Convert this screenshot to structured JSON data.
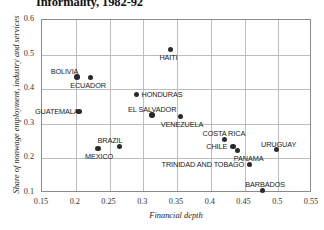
{
  "chart_data": {
    "type": "scatter",
    "title": "Informality, 1982-92",
    "xlabel": "Financial depth",
    "ylabel": "Share of nonwage employment, industry and services",
    "xlim": [
      0.15,
      0.55
    ],
    "ylim": [
      0.1,
      0.6
    ],
    "xticks": [
      "0.15",
      "0.2",
      "0.25",
      "0.3",
      "0.35",
      "0.4",
      "0.45",
      "0.5",
      "0.55"
    ],
    "xtick_values": [
      0.15,
      0.2,
      0.25,
      0.3,
      0.35,
      0.4,
      0.45,
      0.5,
      0.55
    ],
    "yticks": [
      "0.1",
      "0.2",
      "0.3",
      "0.4",
      "0.5",
      "0.6"
    ],
    "ytick_values": [
      0.1,
      0.2,
      0.3,
      0.4,
      0.5,
      0.6
    ],
    "grid": true,
    "legend": "none",
    "marker_color": "#2b2b2b",
    "points": [
      {
        "label": "HAITI",
        "x": 0.34,
        "y": 0.515,
        "label_pos": "below"
      },
      {
        "label": "BOLIVIA",
        "x": 0.202,
        "y": 0.435,
        "label_pos": "above-left"
      },
      {
        "label": "ECUADOR",
        "x": 0.222,
        "y": 0.433,
        "label_pos": "below-left"
      },
      {
        "label": "HONDURAS",
        "x": 0.29,
        "y": 0.385,
        "label_pos": "right"
      },
      {
        "label": "GUATEMALA",
        "x": 0.205,
        "y": 0.335,
        "label_pos": "left"
      },
      {
        "label": "EL SALVADOR",
        "x": 0.313,
        "y": 0.325,
        "label_pos": "above"
      },
      {
        "label": "VENEZUELA",
        "x": 0.355,
        "y": 0.322,
        "label_pos": "below"
      },
      {
        "label": "BRAZIL",
        "x": 0.265,
        "y": 0.235,
        "label_pos": "above-left"
      },
      {
        "label": "MEXICO",
        "x": 0.233,
        "y": 0.228,
        "label_pos": "below"
      },
      {
        "label": "COSTA RICA",
        "x": 0.42,
        "y": 0.255,
        "label_pos": "above"
      },
      {
        "label": "CHILE",
        "x": 0.433,
        "y": 0.235,
        "label_pos": "left"
      },
      {
        "label": "PANAMA",
        "x": 0.44,
        "y": 0.222,
        "label_pos": "below-right"
      },
      {
        "label": "TRINIDAD AND TOBAGO",
        "x": 0.457,
        "y": 0.182,
        "label_pos": "left"
      },
      {
        "label": "URUGUAY",
        "x": 0.497,
        "y": 0.225,
        "label_pos": "above"
      },
      {
        "label": "BARBADOS",
        "x": 0.477,
        "y": 0.108,
        "label_pos": "above"
      }
    ]
  }
}
